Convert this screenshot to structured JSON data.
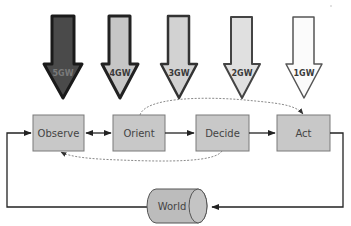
{
  "diagram": {
    "type": "OODA loop with warfare generations",
    "generations": [
      {
        "label": "5GW",
        "fill": "#4a4a4a",
        "text_color": "#7a7a7a"
      },
      {
        "label": "4GW",
        "fill": "#c6c6c6",
        "text_color": "#3a3a3a"
      },
      {
        "label": "3GW",
        "fill": "#d2d2d2",
        "text_color": "#3a3a3a"
      },
      {
        "label": "2GW",
        "fill": "#e0e0e0",
        "text_color": "#3a3a3a"
      },
      {
        "label": "1GW",
        "fill": "#fbfbfb",
        "text_color": "#3a3a3a"
      }
    ],
    "stages": [
      {
        "label": "Observe"
      },
      {
        "label": "Orient"
      },
      {
        "label": "Decide"
      },
      {
        "label": "Act"
      }
    ],
    "world": {
      "label": "World"
    },
    "colors": {
      "box_fill": "#c8c8c8",
      "box_stroke": "#7a7a7a",
      "line": "#222222",
      "dashed": "#8a8a8a",
      "text": "#444444"
    },
    "connections": [
      {
        "from": "Observe",
        "to": "Orient",
        "style": "solid",
        "bidirectional": true
      },
      {
        "from": "Orient",
        "to": "Decide",
        "style": "solid"
      },
      {
        "from": "Decide",
        "to": "Act",
        "style": "solid"
      },
      {
        "from": "Orient",
        "to": "Act",
        "style": "dashed"
      },
      {
        "from": "Decide",
        "to": "Observe",
        "style": "dashed"
      },
      {
        "from": "Act",
        "to": "World",
        "style": "solid"
      },
      {
        "from": "World",
        "to": "Observe",
        "style": "solid"
      }
    ]
  }
}
